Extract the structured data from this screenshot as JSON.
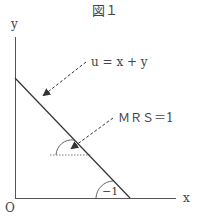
{
  "figure": {
    "title": "図１",
    "axis_labels": {
      "x": "x",
      "y": "y",
      "origin": "O"
    },
    "annotations": {
      "utility": "u = x + y",
      "mrs": "ＭＲＳ＝1",
      "slope": "−1"
    }
  }
}
